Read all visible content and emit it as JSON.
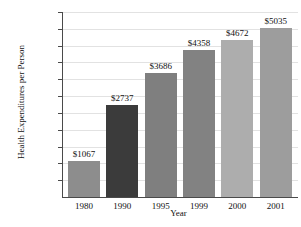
{
  "chart_data": {
    "type": "bar",
    "title": "",
    "xlabel": "Year",
    "ylabel": "Health Expenditures per Person",
    "categories": [
      "1980",
      "1990",
      "1995",
      "1999",
      "2000",
      "2001"
    ],
    "values": [
      1067,
      2737,
      3686,
      4358,
      4672,
      5035
    ],
    "value_labels": [
      "$1067",
      "$2737",
      "$3686",
      "$4358",
      "$4672",
      "$5035"
    ],
    "ylim": [
      0,
      5500
    ],
    "ytick_values": [
      500,
      1000,
      1500,
      2000,
      2500,
      3000,
      3500,
      4000,
      4500,
      5000,
      5500
    ],
    "ytick_labels": [
      "$500",
      "$1000",
      "$1500",
      "$2000",
      "$2500",
      "$3000",
      "$3500",
      "$4000",
      "$4500",
      "$5000",
      "$5500"
    ],
    "grid": true,
    "legend": "none",
    "bar_colors": [
      "#8d8d8d",
      "#3b3b3b",
      "#7f7f7f",
      "#828282",
      "#adadad",
      "#9d9d9d"
    ],
    "axis_color": "#4a4a4a",
    "grid_color": "#e2e2e2",
    "background": "#ffffff"
  }
}
